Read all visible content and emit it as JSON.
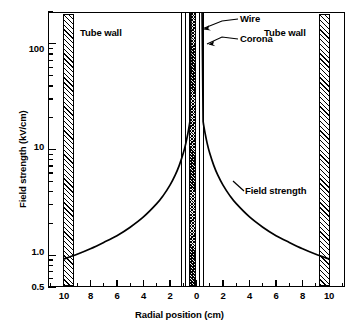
{
  "chart_data": {
    "type": "line",
    "title": "",
    "xlabel": "Radial position (cm)",
    "ylabel": "Field strength (kV/cm)",
    "yscale": "log",
    "ylim": [
      0.5,
      200
    ],
    "xlim": [
      -11.2,
      11.2
    ],
    "grid": false,
    "legend": "none",
    "y_tick_labels": [
      "100",
      "10",
      "1.0",
      "0.5"
    ],
    "y_tick_values": [
      100,
      10,
      1.0,
      0.5
    ],
    "y_minor_ticks": [
      0.6,
      0.7,
      0.8,
      0.9,
      2,
      3,
      4,
      5,
      6,
      7,
      8,
      9,
      20,
      30,
      40,
      50,
      60,
      70,
      80,
      90,
      200
    ],
    "x_tick_labels": [
      "10",
      "8",
      "6",
      "4",
      "2",
      "0",
      "2",
      "4",
      "6",
      "8",
      "10"
    ],
    "x_tick_values": [
      -10,
      -8,
      -6,
      -4,
      -2,
      0,
      2,
      4,
      6,
      8,
      10
    ],
    "series": [
      {
        "name": "Field strength",
        "x": [
          -10.0,
          -9.0,
          -8.0,
          -7.0,
          -6.0,
          -5.0,
          -4.0,
          -3.0,
          -2.5,
          -2.0,
          -1.6,
          -1.3,
          -1.0,
          -0.8,
          -0.65,
          -0.55,
          -0.5,
          0.5,
          0.55,
          0.65,
          0.8,
          1.0,
          1.3,
          1.6,
          2.0,
          2.5,
          3.0,
          4.0,
          5.0,
          6.0,
          7.0,
          8.0,
          9.0,
          10.0
        ],
        "y": [
          0.92,
          1.02,
          1.15,
          1.32,
          1.53,
          1.84,
          2.3,
          3.07,
          3.68,
          4.6,
          5.75,
          7.08,
          9.2,
          11.5,
          14.2,
          16.7,
          18.4,
          18.4,
          16.7,
          14.2,
          11.5,
          9.2,
          7.08,
          5.75,
          4.6,
          3.68,
          3.07,
          2.3,
          1.84,
          1.53,
          1.32,
          1.15,
          1.02,
          0.92
        ]
      }
    ],
    "annotations": [
      {
        "name": "wire",
        "label": "Wire",
        "x": 0.0,
        "note": "central conductor, dense hatched column"
      },
      {
        "name": "corona",
        "label": "Corona",
        "x": 0.45,
        "note": "corona sheath boundary lines either side of wire"
      },
      {
        "name": "tube-wall-left",
        "label": "Tube wall",
        "x": -10.0
      },
      {
        "name": "tube-wall-right",
        "label": "Tube wall",
        "x": 10.0
      },
      {
        "name": "curve-label",
        "label": "Field strength",
        "x": 5.0,
        "y": 2.6
      }
    ]
  },
  "axes": {
    "y_title": "Field strength (kV/cm)",
    "x_title": "Radial position (cm)",
    "y_labels": [
      {
        "text": "100",
        "value": 100
      },
      {
        "text": "10",
        "value": 10
      },
      {
        "text": "1.0",
        "value": 1.0
      },
      {
        "text": "0.5",
        "value": 0.5
      }
    ],
    "x_labels": [
      {
        "text": "10",
        "value": -10
      },
      {
        "text": "8",
        "value": -8
      },
      {
        "text": "6",
        "value": -6
      },
      {
        "text": "4",
        "value": -4
      },
      {
        "text": "2",
        "value": -2
      },
      {
        "text": "0",
        "value": 0
      },
      {
        "text": "2",
        "value": 2
      },
      {
        "text": "4",
        "value": 4
      },
      {
        "text": "6",
        "value": 6
      },
      {
        "text": "8",
        "value": 8
      },
      {
        "text": "10",
        "value": 10
      }
    ]
  },
  "labels": {
    "tube_wall_left": "Tube wall",
    "tube_wall_right": "Tube wall",
    "wire": "Wire",
    "corona": "Corona",
    "field_strength": "Field strength"
  },
  "colors": {
    "ink": "#000000",
    "paper": "#ffffff",
    "curve": "#000000"
  }
}
